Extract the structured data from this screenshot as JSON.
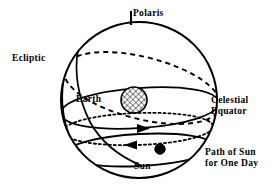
{
  "diagram": {
    "background_color": "#ffffff",
    "line_color": "#000000",
    "labels": {
      "polaris": "Polaris",
      "ecliptic": "Ecliptic",
      "earth": "Earth",
      "celestial_equator_line1": "Celestial",
      "celestial_equator_line2": "Equator",
      "sun": "Sun",
      "sun_path_line1": "Path of Sun",
      "sun_path_line2": "for One Day"
    },
    "objects": {
      "celestial_sphere": {
        "name": "celestial-sphere",
        "center_x": 139,
        "center_y": 100,
        "radius": 78,
        "stroke_width": 2
      },
      "polaris_tick": {
        "name": "polaris-tick",
        "x": 131,
        "y_top": 12,
        "y_bottom": 24
      },
      "earth": {
        "name": "earth",
        "center_x": 134,
        "center_y": 100,
        "radius": 13,
        "fill": "crosshatch"
      },
      "sun": {
        "name": "sun",
        "center_x": 160,
        "center_y": 149,
        "radius": 5,
        "fill": "#000000"
      }
    },
    "curves": {
      "celestial_equator": {
        "style": "solid",
        "name": "celestial-equator-ellipse"
      },
      "ecliptic": {
        "style": "dashed",
        "name": "ecliptic-ellipse"
      },
      "sun_daily_path": {
        "style": "solid",
        "name": "sun-daily-path-ellipse"
      },
      "dotted_path": {
        "style": "dotted",
        "name": "dotted-path-ellipse"
      },
      "meridian": {
        "style": "solid",
        "name": "meridian-arc"
      }
    },
    "arrows": {
      "dotted_path_arrow_direction": "right",
      "sun_path_arrow_direction": "left"
    }
  }
}
